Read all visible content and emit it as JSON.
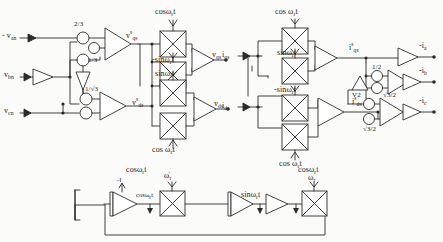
{
  "diagram": {
    "type": "signal-flow-block-diagram",
    "stroke_color": "#2b2b2b",
    "background_color": "#fbfbf9"
  },
  "left_section": {
    "inputs": [
      {
        "id": "van",
        "label_html": "- v<sub>an</sub>",
        "x": 4,
        "y": 34
      },
      {
        "id": "vbn",
        "label_html": "v<sub>bn</sub>",
        "x": 6,
        "y": 73
      },
      {
        "id": "vcn",
        "label_html": "v<sub>cn</sub>",
        "x": 6,
        "y": 110
      }
    ],
    "gains": [
      {
        "id": "gain-2-3",
        "label": "2/3",
        "x": 72,
        "y": 10
      },
      {
        "id": "gain-1-3",
        "label": "1/3",
        "x": 82,
        "y": 53
      },
      {
        "id": "gain-1-sqrt3",
        "label": "1/√3",
        "x": 80,
        "y": 90
      }
    ],
    "intermediate": [
      {
        "id": "vqs-s",
        "label_html": "v<sup>s</sup><sub>qs</sub>",
        "x": 111,
        "y": 29
      },
      {
        "id": "vds-s",
        "label_html": "v<sup>s</sup><sub>ds</sub>",
        "x": 116,
        "y": 103
      }
    ],
    "multiplier_labels": [
      {
        "id": "mult-cos-1",
        "label_html": "cosω<sub>r</sub>t",
        "x": 146,
        "y": 4
      },
      {
        "id": "mult-nsin-1",
        "label_html": "-sinω<sub>r</sub>t",
        "x": 143,
        "y": 53
      },
      {
        "id": "mult-sin-1",
        "label_html": "sinω<sub>r</sub>t",
        "x": 145,
        "y": 70
      },
      {
        "id": "mult-cos-2",
        "label_html": "cos ω<sub>r</sub>t",
        "x": 143,
        "y": 130
      }
    ],
    "outputs": [
      {
        "id": "vqs",
        "label_html": "v<sub>qs</sub>",
        "x": 197,
        "y": 52
      },
      {
        "id": "vds",
        "label_html": "v<sub>ds</sub>",
        "x": 198,
        "y": 99
      }
    ]
  },
  "right_section": {
    "inputs": [
      {
        "id": "iqs",
        "label_html": "i<sub>qs</sub>",
        "x": 224,
        "y": 52
      },
      {
        "id": "ids",
        "label_html": "i<sub>ds</sub>",
        "x": 224,
        "y": 102
      }
    ],
    "multiplier_labels": [
      {
        "id": "mult-cos-3",
        "label_html": "cos ω<sub>r</sub>t",
        "x": 268,
        "y": 13
      },
      {
        "id": "mult-sin-2",
        "label_html": "sinω<sub>r</sub>t",
        "x": 270,
        "y": 49
      },
      {
        "id": "mult-nsin-2",
        "label_html": "-sinω<sub>r</sub>t",
        "x": 269,
        "y": 87
      },
      {
        "id": "mult-cos-4",
        "label_html": "cos ω<sub>r</sub>t",
        "x": 272,
        "y": 142
      }
    ],
    "intermediate": [
      {
        "id": "iqs-s",
        "label_html": "i<sup>s</sup><sub>qs</sub>",
        "x": 342,
        "y": 48
      },
      {
        "id": "ids-s",
        "label_html": "i<sup>s</sup><sub>ds</sub>",
        "x": 351,
        "y": 99
      }
    ],
    "gains": [
      {
        "id": "gain-half",
        "label": "1/2",
        "x": 375,
        "y": 68
      },
      {
        "id": "gain-sqrt32-a",
        "label": "√3/2",
        "x": 382,
        "y": 88
      },
      {
        "id": "gain-v2",
        "label": "V2",
        "x": 366,
        "y": 90
      },
      {
        "id": "gain-sqrt32-b",
        "label": "√3/2",
        "x": 373,
        "y": 120
      }
    ],
    "outputs": [
      {
        "id": "ia",
        "label_html": "-i<sub>a</sub>",
        "x": 424,
        "y": 45
      },
      {
        "id": "ib",
        "label_html": "-i<sub>b</sub>",
        "x": 424,
        "y": 72
      },
      {
        "id": "ic",
        "label_html": "-i<sub>c</sub>",
        "x": 424,
        "y": 102
      }
    ]
  },
  "bottom_loop": {
    "labels": [
      {
        "id": "bottom-neg-one",
        "label": "-l",
        "x": 117,
        "y": 180
      },
      {
        "id": "bottom-cos-top",
        "label_html": "cosω<sub>r</sub>t",
        "x": 133,
        "y": 168
      },
      {
        "id": "bottom-cos-inline",
        "label_html": "cosω<sub>r</sub>t",
        "x": 136,
        "y": 189
      },
      {
        "id": "bottom-omega-dot",
        "label_html": "ω̇<sub>r</sub>",
        "x": 162,
        "y": 176
      },
      {
        "id": "bottom-sin",
        "label_html": "sinω<sub>r</sub>t",
        "x": 243,
        "y": 188
      },
      {
        "id": "bottom-cos-right",
        "label_html": "cosω<sub>r</sub>t",
        "x": 297,
        "y": 167
      },
      {
        "id": "bottom-omega-r",
        "label_html": "ω<sub>r</sub>",
        "x": 307,
        "y": 177
      }
    ]
  }
}
